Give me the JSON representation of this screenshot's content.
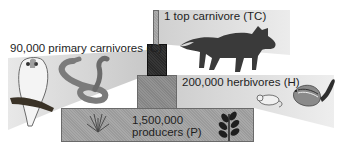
{
  "diagram": {
    "type": "ecological-pyramid-of-numbers",
    "levels": [
      {
        "id": "TC",
        "label": "1 top carnivore (TC)",
        "count": 1,
        "organism": "fox"
      },
      {
        "id": "C",
        "label": "90,000 primary carnivores (C)",
        "count": 90000,
        "organisms": [
          "owl",
          "snake"
        ]
      },
      {
        "id": "H",
        "label": "200,000 herbivores (H)",
        "count": 200000,
        "organisms": [
          "mouse",
          "chipmunk"
        ]
      },
      {
        "id": "P",
        "label_line1": "1,500,000",
        "label_line2": "producers (P)",
        "count": 1500000,
        "organisms": [
          "grass",
          "leafy-plant"
        ]
      }
    ],
    "colors": {
      "wedge": "#d9d9d9",
      "tc_bar": "#a8a8a8",
      "c_bar": "#2b2b2b",
      "h_bar": "#8c8c8c",
      "p_bar": "#a3a3a3"
    }
  }
}
